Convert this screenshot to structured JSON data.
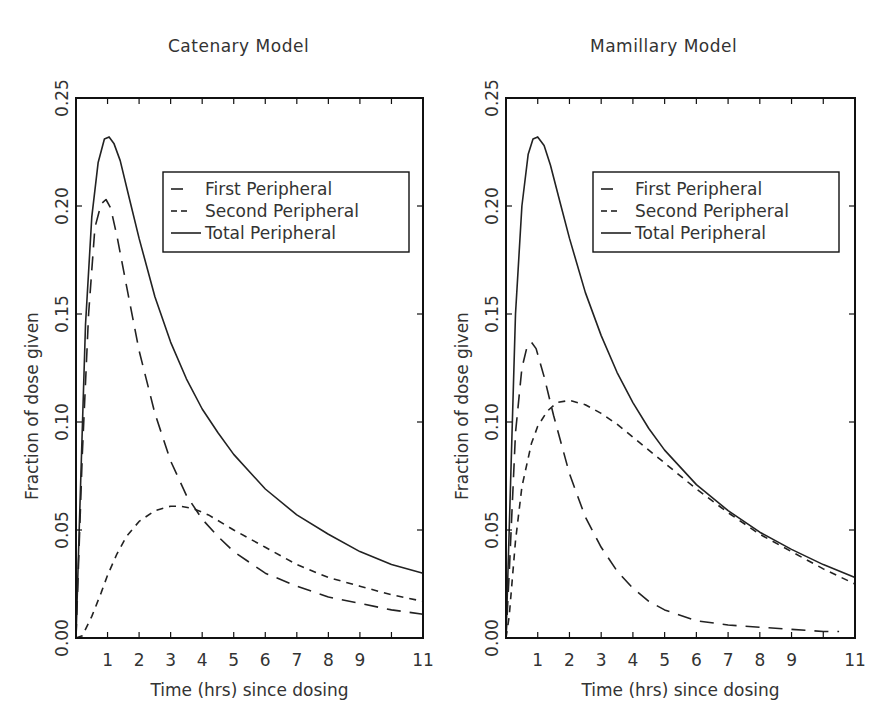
{
  "figure": {
    "width": 896,
    "height": 726
  },
  "chart_data": [
    {
      "type": "line",
      "title": "Catenary Model",
      "xlabel": "Time (hrs) since dosing",
      "ylabel": "Fraction of dose given",
      "xlim": [
        0,
        11
      ],
      "ylim": [
        0,
        0.25
      ],
      "xticks": [
        1,
        2,
        3,
        4,
        5,
        6,
        7,
        8,
        9,
        11
      ],
      "xtick_minor": [
        10
      ],
      "yticks": [
        "0.00",
        "0.05",
        "0.10",
        "0.15",
        "0.20",
        "0.25"
      ],
      "grid": false,
      "legend_position": "upper right",
      "legend": [
        "First Peripheral",
        "Second Peripheral",
        "Total Peripheral"
      ],
      "series": [
        {
          "name": "First Peripheral",
          "style": "long-dash",
          "x": [
            0,
            0.2,
            0.4,
            0.6,
            0.8,
            0.95,
            1.1,
            1.3,
            1.6,
            2.0,
            2.5,
            3.0,
            3.5,
            4.0,
            4.5,
            5.0,
            5.5,
            6.0,
            7.0,
            8.0,
            9.0,
            10.0,
            11.0
          ],
          "y": [
            0,
            0.085,
            0.15,
            0.19,
            0.201,
            0.203,
            0.199,
            0.186,
            0.163,
            0.133,
            0.104,
            0.082,
            0.066,
            0.055,
            0.047,
            0.04,
            0.035,
            0.03,
            0.024,
            0.019,
            0.016,
            0.013,
            0.011
          ]
        },
        {
          "name": "Second Peripheral",
          "style": "short-dash",
          "x": [
            0,
            0.2,
            0.5,
            0.8,
            1.0,
            1.3,
            1.6,
            2.0,
            2.5,
            3.0,
            3.3,
            3.7,
            4.2,
            5.0,
            6.0,
            7.0,
            8.0,
            9.0,
            10.0,
            11.0
          ],
          "y": [
            0,
            0.001,
            0.01,
            0.021,
            0.029,
            0.039,
            0.047,
            0.054,
            0.059,
            0.061,
            0.061,
            0.06,
            0.057,
            0.05,
            0.042,
            0.034,
            0.028,
            0.024,
            0.02,
            0.017
          ]
        },
        {
          "name": "Total Peripheral",
          "style": "solid",
          "x": [
            0,
            0.1,
            0.3,
            0.5,
            0.7,
            0.9,
            1.05,
            1.2,
            1.4,
            1.7,
            2.0,
            2.5,
            3.0,
            3.5,
            4.0,
            4.5,
            5.0,
            6.0,
            7.0,
            8.0,
            9.0,
            10.0,
            11.0
          ],
          "y": [
            0,
            0.05,
            0.145,
            0.195,
            0.22,
            0.231,
            0.232,
            0.229,
            0.221,
            0.203,
            0.185,
            0.158,
            0.137,
            0.12,
            0.106,
            0.095,
            0.085,
            0.069,
            0.057,
            0.048,
            0.04,
            0.034,
            0.03
          ]
        }
      ]
    },
    {
      "type": "line",
      "title": "Mamillary Model",
      "xlabel": "Time (hrs) since dosing",
      "ylabel": "Fraction of dose given",
      "xlim": [
        0,
        11
      ],
      "ylim": [
        0,
        0.25
      ],
      "xticks": [
        1,
        2,
        3,
        4,
        5,
        6,
        7,
        8,
        9,
        11
      ],
      "xtick_minor": [
        10
      ],
      "yticks": [
        "0.00",
        "0.05",
        "0.10",
        "0.15",
        "0.20",
        "0.25"
      ],
      "grid": false,
      "legend_position": "upper right",
      "legend": [
        "First Peripheral",
        "Second Peripheral",
        "Total Peripheral"
      ],
      "series": [
        {
          "name": "First Peripheral",
          "style": "long-dash",
          "x": [
            0,
            0.1,
            0.3,
            0.5,
            0.65,
            0.8,
            0.95,
            1.2,
            1.5,
            2.0,
            2.5,
            3.0,
            3.5,
            4.0,
            4.5,
            5.0,
            6.0,
            7.0,
            8.0,
            9.0,
            10.0,
            10.5
          ],
          "y": [
            0,
            0.03,
            0.095,
            0.125,
            0.134,
            0.137,
            0.134,
            0.121,
            0.103,
            0.076,
            0.056,
            0.042,
            0.031,
            0.023,
            0.017,
            0.013,
            0.008,
            0.006,
            0.005,
            0.004,
            0.003,
            0.003
          ]
        },
        {
          "name": "Second Peripheral",
          "style": "short-dash",
          "x": [
            0,
            0.1,
            0.3,
            0.5,
            0.8,
            1.0,
            1.3,
            1.6,
            2.0,
            2.5,
            3.0,
            3.5,
            4.0,
            5.0,
            6.0,
            7.0,
            8.0,
            9.0,
            10.0,
            11.0
          ],
          "y": [
            0,
            0.01,
            0.045,
            0.07,
            0.09,
            0.098,
            0.105,
            0.109,
            0.11,
            0.108,
            0.104,
            0.099,
            0.093,
            0.081,
            0.069,
            0.058,
            0.048,
            0.04,
            0.032,
            0.025
          ]
        },
        {
          "name": "Total Peripheral",
          "style": "solid",
          "x": [
            0,
            0.1,
            0.3,
            0.5,
            0.7,
            0.85,
            1.0,
            1.2,
            1.4,
            1.7,
            2.0,
            2.5,
            3.0,
            3.5,
            4.0,
            4.5,
            5.0,
            6.0,
            7.0,
            8.0,
            9.0,
            10.0,
            11.0
          ],
          "y": [
            0,
            0.05,
            0.15,
            0.2,
            0.224,
            0.231,
            0.232,
            0.228,
            0.219,
            0.202,
            0.185,
            0.16,
            0.14,
            0.123,
            0.109,
            0.097,
            0.087,
            0.071,
            0.059,
            0.049,
            0.041,
            0.034,
            0.028
          ]
        }
      ]
    }
  ],
  "panels": {
    "left": {
      "title": "Catenary Model",
      "xlabel": "Time (hrs) since dosing",
      "ylabel": "Fraction of dose given"
    },
    "right": {
      "title": "Mamillary Model",
      "xlabel": "Time (hrs) since dosing",
      "ylabel": "Fraction of dose given"
    }
  },
  "legend": {
    "items": [
      {
        "label": "First Peripheral",
        "glyph": "–"
      },
      {
        "label": "Second Peripheral",
        "glyph": "- -"
      },
      {
        "label": "Total Peripheral",
        "glyph": "——"
      }
    ]
  },
  "colors": {
    "line": "#222222",
    "frame": "#111111",
    "text": "#333333",
    "background": "#ffffff"
  }
}
